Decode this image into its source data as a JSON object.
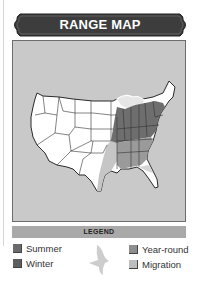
{
  "header": {
    "title": "RANGE MAP",
    "banner_color": "#3d3d3d"
  },
  "map": {
    "background_color": "#c9c9c9",
    "land_color": "#ffffff",
    "region": "Contiguous United States",
    "shaded_regions": [
      {
        "type": "summer",
        "area": "Midwest / Ohio Valley / Northeast interior",
        "color": "#6e6e6e"
      },
      {
        "type": "year-round",
        "area": "Southeast states",
        "color": "#9a9a9a"
      },
      {
        "type": "migration",
        "area": "Great Lakes fringe, east Texas/Gulf, Florida edge",
        "color": "#c8c8c8"
      }
    ]
  },
  "legend": {
    "title": "LEGEND",
    "bar_color": "#a9a9a9",
    "items": [
      {
        "label": "Summer",
        "color": "#6b6b6b"
      },
      {
        "label": "Winter",
        "color": "#5e5e5e"
      },
      {
        "label": "Year-round",
        "color": "#8e8e8e"
      },
      {
        "label": "Migration",
        "color": "#bdbdbd"
      }
    ],
    "icon": "bird-silhouette"
  }
}
